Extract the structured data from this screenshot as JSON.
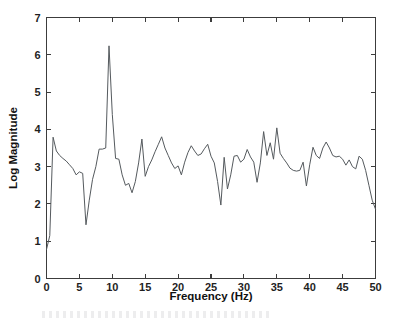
{
  "chart_data": {
    "type": "line",
    "title": "",
    "subtitle": "",
    "xlabel": "Frequency (Hz)",
    "ylabel": "Log Magnitude",
    "xlim": [
      0,
      50
    ],
    "ylim": [
      0,
      7
    ],
    "xticks": [
      0,
      5,
      10,
      15,
      20,
      25,
      30,
      35,
      40,
      45,
      50
    ],
    "xticklabels": [
      "0",
      "5",
      "10",
      "15",
      "20",
      "25",
      "30",
      "35",
      "40",
      "45",
      "50"
    ],
    "yticks": [
      0,
      1,
      2,
      3,
      4,
      5,
      6,
      7
    ],
    "yticklabels": [
      "0",
      "1",
      "2",
      "3",
      "4",
      "5",
      "6",
      "7"
    ],
    "grid": false,
    "legend": false,
    "legend_position": "none",
    "line_color": "#555a5e",
    "axis_color": "#3c3c3c",
    "background_color": "#ffffff",
    "x": [
      0,
      0.5,
      1,
      1.5,
      2,
      2.5,
      3,
      3.5,
      4,
      4.5,
      5,
      5.5,
      6,
      6.5,
      7,
      7.5,
      8,
      8.5,
      9,
      9.5,
      10,
      10.5,
      11,
      11.5,
      12,
      12.5,
      13,
      13.5,
      14,
      14.5,
      15,
      15.5,
      16,
      16.5,
      17,
      17.5,
      18,
      18.5,
      19,
      19.5,
      20,
      20.5,
      21,
      21.5,
      22,
      22.5,
      23,
      23.5,
      24,
      24.5,
      25,
      25.5,
      26,
      26.5,
      27,
      27.5,
      28,
      28.5,
      29,
      29.5,
      30,
      30.5,
      31,
      31.5,
      32,
      32.5,
      33,
      33.5,
      34,
      34.5,
      35,
      35.5,
      36,
      36.5,
      37,
      37.5,
      38,
      38.5,
      39,
      39.5,
      40,
      40.5,
      41,
      41.5,
      42,
      42.5,
      43,
      43.5,
      44,
      44.5,
      45,
      45.5,
      46,
      46.5,
      47,
      47.5,
      48,
      48.5,
      49,
      49.5,
      50
    ],
    "y": [
      0.78,
      1.15,
      3.79,
      3.42,
      3.3,
      3.22,
      3.15,
      3.05,
      2.95,
      2.78,
      2.86,
      2.82,
      1.44,
      2.1,
      2.66,
      3.0,
      3.47,
      3.47,
      3.5,
      6.24,
      4.4,
      3.22,
      3.2,
      2.78,
      2.5,
      2.55,
      2.3,
      2.6,
      3.1,
      3.74,
      2.74,
      3.0,
      3.18,
      3.4,
      3.6,
      3.8,
      3.5,
      3.3,
      3.1,
      2.95,
      3.02,
      2.78,
      3.12,
      3.38,
      3.56,
      3.42,
      3.3,
      3.34,
      3.48,
      3.6,
      3.28,
      3.1,
      2.6,
      1.97,
      3.25,
      2.4,
      2.78,
      3.28,
      3.3,
      3.12,
      3.2,
      3.46,
      3.26,
      3.12,
      2.58,
      3.1,
      3.94,
      3.3,
      3.64,
      3.2,
      4.04,
      3.36,
      3.22,
      3.1,
      2.96,
      2.9,
      2.88,
      2.9,
      3.12,
      2.48,
      3.05,
      3.52,
      3.3,
      3.22,
      3.5,
      3.66,
      3.5,
      3.3,
      3.26,
      3.28,
      3.2,
      3.04,
      3.18,
      3.0,
      2.94,
      3.28,
      3.2,
      2.9,
      2.5,
      2.1,
      1.86
    ],
    "peak_annotation": {
      "x": 9.5,
      "y": 6.24,
      "label": "dominant peak near 10 Hz"
    }
  },
  "axes": {
    "x_tick_labels": [
      "0",
      "5",
      "10",
      "15",
      "20",
      "25",
      "30",
      "35",
      "40",
      "45",
      "50"
    ],
    "y_tick_labels": [
      "0",
      "1",
      "2",
      "3",
      "4",
      "5",
      "6",
      "7"
    ],
    "x_axis_title": "Frequency (Hz)",
    "y_axis_title": "Log Magnitude"
  }
}
